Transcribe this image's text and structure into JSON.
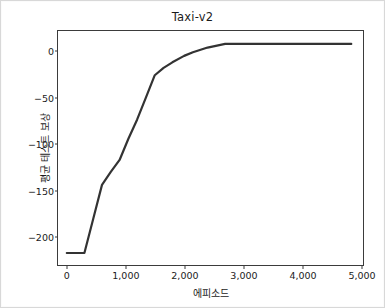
{
  "figure": {
    "title": "Taxi-v2",
    "background_color": "#ffffff",
    "border_color": "#d8d8d8"
  },
  "axes": {
    "xlabel": "에피소드",
    "ylabel": "평균 테스트 보상",
    "xticks": [
      "0",
      "1,000",
      "2,000",
      "3,000",
      "4,000",
      "5,000"
    ],
    "yticks": [
      "0",
      "−50",
      "−100",
      "−150",
      "−200"
    ],
    "spine_color": "#3b3b3b",
    "tick_label_color": "#1b1b1b"
  },
  "chart_data": {
    "type": "line",
    "title": "Taxi-v2",
    "xlabel": "에피소드",
    "ylabel": "평균 테스트 보상",
    "xlim": [
      -150,
      5050
    ],
    "ylim": [
      -232,
      22
    ],
    "xticks": [
      0,
      1000,
      2000,
      3000,
      4000,
      5000
    ],
    "yticks": [
      0,
      -50,
      -100,
      -150,
      -200
    ],
    "xtick_labels": [
      "0",
      "1,000",
      "2,000",
      "3,000",
      "4,000",
      "5,000"
    ],
    "ytick_labels": [
      "0",
      "−50",
      "−100",
      "−150",
      "−200"
    ],
    "grid": false,
    "legend": false,
    "series": [
      {
        "name": "평균 테스트 보상",
        "color": "#333333",
        "linewidth": 2.2,
        "x": [
          0,
          150,
          300,
          450,
          600,
          750,
          900,
          1050,
          1200,
          1350,
          1500,
          1650,
          1800,
          2000,
          2150,
          2400,
          2700,
          3000,
          3500,
          4000,
          4500,
          4850
        ],
        "y": [
          -219,
          -219,
          -219,
          -182,
          -145,
          -131,
          -118,
          -95,
          -74,
          -50,
          -26,
          -18,
          -12,
          -5,
          -1,
          4,
          8,
          8,
          8,
          8,
          8,
          8
        ]
      }
    ]
  }
}
